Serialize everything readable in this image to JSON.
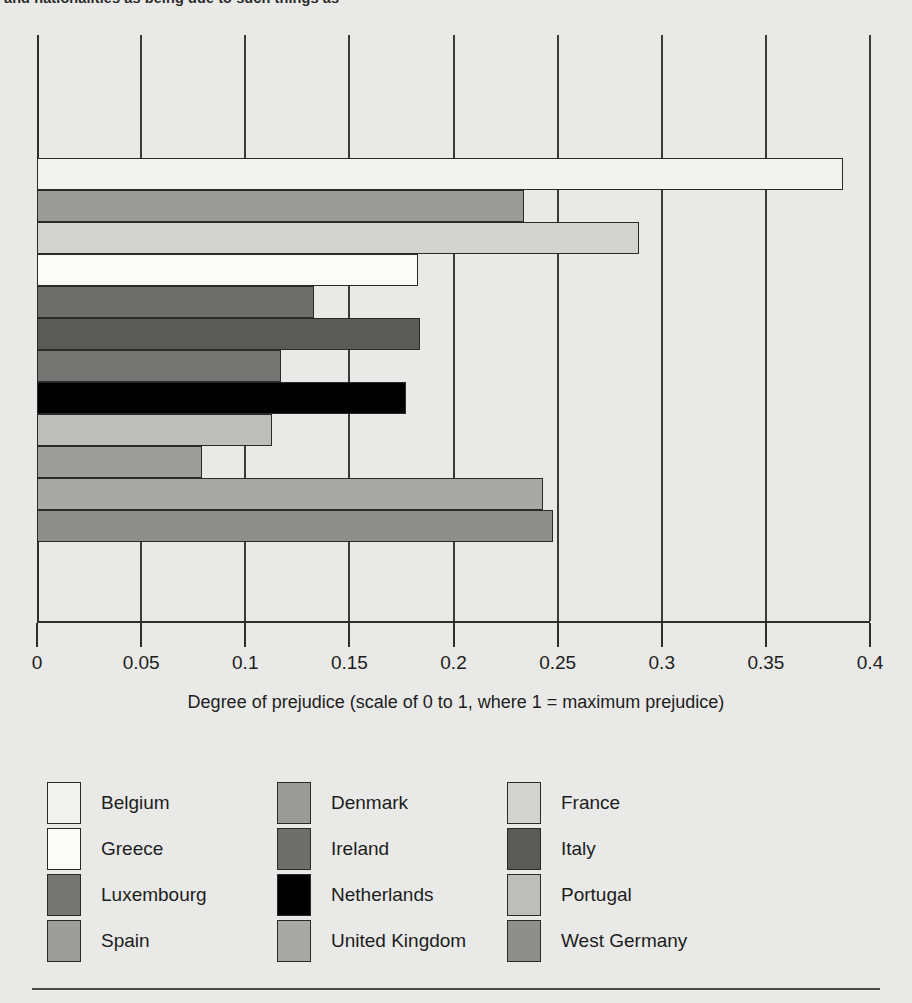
{
  "caption": {
    "text": "and nationalities as being due to such things as"
  },
  "chart_data": {
    "type": "bar",
    "orientation": "horizontal",
    "title": "",
    "xlabel": "Degree of prejudice (scale of 0 to 1, where 1 = maximum prejudice)",
    "ylabel": "",
    "xlim": [
      0,
      0.4
    ],
    "xticks": [
      "0",
      "0.05",
      "0.1",
      "0.15",
      "0.2",
      "0.25",
      "0.3",
      "0.35",
      "0.4"
    ],
    "xtick_values": [
      0,
      0.05,
      0.1,
      0.15,
      0.2,
      0.25,
      0.3,
      0.35,
      0.4
    ],
    "grid": true,
    "grid_axis": "x",
    "legend_position": "bottom",
    "categories": [
      "Belgium",
      "Denmark",
      "France",
      "Greece",
      "Ireland",
      "Italy",
      "Luxembourg",
      "Netherlands",
      "Portugal",
      "Spain",
      "United Kingdom",
      "West Germany"
    ],
    "values": [
      0.387,
      0.234,
      0.289,
      0.183,
      0.133,
      0.184,
      0.117,
      0.177,
      0.113,
      0.079,
      0.243,
      0.248
    ],
    "colors": [
      "#f2f2f0",
      "#9a9a98",
      "#d2d2d0",
      "#fbfbfa",
      "#6e6e6c",
      "#5a5a58",
      "#757573",
      "#000000",
      "#bdbdbb",
      "#9d9d9b",
      "#a8a8a6",
      "#8e8e8c"
    ]
  },
  "legend": {
    "items": [
      {
        "label": "Belgium",
        "color": "#f2f2f0"
      },
      {
        "label": "Denmark",
        "color": "#9a9a98"
      },
      {
        "label": "France",
        "color": "#d2d2d0"
      },
      {
        "label": "Greece",
        "color": "#fbfbfa"
      },
      {
        "label": "Ireland",
        "color": "#6e6e6c"
      },
      {
        "label": "Italy",
        "color": "#5a5a58"
      },
      {
        "label": "Luxembourg",
        "color": "#757573"
      },
      {
        "label": "Netherlands",
        "color": "#000000"
      },
      {
        "label": "Portugal",
        "color": "#bdbdbb"
      },
      {
        "label": "Spain",
        "color": "#9d9d9b"
      },
      {
        "label": "United Kingdom",
        "color": "#a8a8a6"
      },
      {
        "label": "West Germany",
        "color": "#8e8e8c"
      }
    ]
  }
}
